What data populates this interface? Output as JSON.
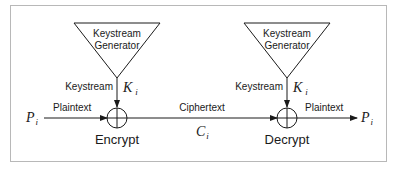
{
  "diagram": {
    "type": "stream-cipher-block-diagram",
    "colors": {
      "line": "#1a1a1a",
      "frame": "#b8b8b8",
      "background": "#ffffff"
    },
    "encrypt_side": {
      "generator": {
        "line1": "Keystream",
        "line2": "Generator"
      },
      "keystream_label": "Keystream",
      "key_symbol": "K",
      "key_subscript": "i",
      "input_symbol": "P",
      "input_subscript": "i",
      "input_label": "Plaintext",
      "operator_label": "Encrypt"
    },
    "channel": {
      "label": "Ciphertext",
      "symbol": "C",
      "subscript": "i"
    },
    "decrypt_side": {
      "generator": {
        "line1": "Keystream",
        "line2": "Generator"
      },
      "keystream_label": "Keystream",
      "key_symbol": "K",
      "key_subscript": "i",
      "output_label": "Plaintext",
      "output_symbol": "P",
      "output_subscript": "i",
      "operator_label": "Decrypt"
    }
  }
}
